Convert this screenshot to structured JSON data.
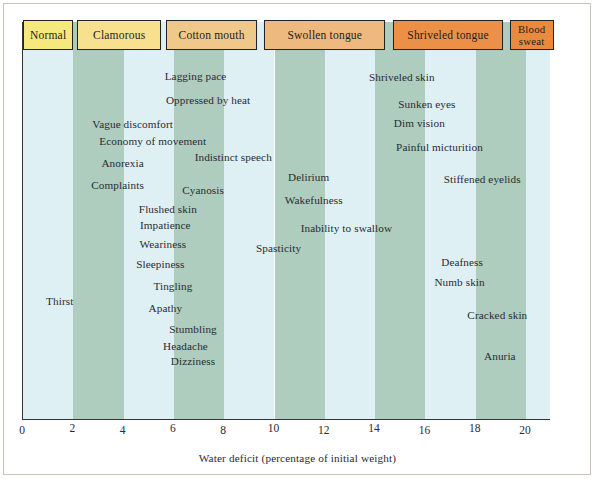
{
  "chart_data": {
    "type": "table",
    "title": "",
    "xlabel": "Water deficit (percentage of initial weight)",
    "ylabel": "",
    "xlim": [
      0,
      21
    ],
    "xticks": [
      0,
      2,
      4,
      6,
      8,
      10,
      12,
      14,
      16,
      18,
      20
    ],
    "xtick_labels": [
      "0",
      "2",
      "4",
      "6",
      "8",
      "10",
      "12",
      "14",
      "16",
      "18",
      "20"
    ],
    "grid": false,
    "band_pattern": "alternating 2-unit vertical bands",
    "band_colors": [
      "#dff0f5",
      "#aecdbe"
    ],
    "stages": [
      {
        "label": "Normal",
        "x_start": 0.0,
        "x_end": 2.0,
        "color": "#f5e87c"
      },
      {
        "label": "Clamorous",
        "x_start": 2.15,
        "x_end": 5.5,
        "color": "#f7e08e"
      },
      {
        "label": "Cotton mouth",
        "x_start": 5.7,
        "x_end": 9.3,
        "color": "#f0c98a"
      },
      {
        "label": "Swollen tongue",
        "x_start": 9.6,
        "x_end": 14.4,
        "color": "#eeb97e"
      },
      {
        "label": "Shriveled tongue",
        "x_start": 14.7,
        "x_end": 19.1,
        "color": "#ec9047"
      },
      {
        "label": "Blood sweat",
        "x_start": 19.35,
        "x_end": 21.1,
        "color": "#ea8a3c"
      }
    ],
    "symptoms": [
      {
        "label": "Lagging pace",
        "x": 6.9,
        "y": 71
      },
      {
        "label": "Oppressed by heat",
        "x": 7.4,
        "y": 95
      },
      {
        "label": "Vague discomfort",
        "x": 4.4,
        "y": 119
      },
      {
        "label": "Economy of movement",
        "x": 5.2,
        "y": 136
      },
      {
        "label": "Anorexia",
        "x": 4.0,
        "y": 158
      },
      {
        "label": "Indistinct speech",
        "x": 8.4,
        "y": 152
      },
      {
        "label": "Complaints",
        "x": 3.8,
        "y": 180
      },
      {
        "label": "Cyanosis",
        "x": 7.2,
        "y": 185
      },
      {
        "label": "Delirium",
        "x": 11.4,
        "y": 172
      },
      {
        "label": "Wakefulness",
        "x": 11.6,
        "y": 195
      },
      {
        "label": "Shriveled skin",
        "x": 15.1,
        "y": 72
      },
      {
        "label": "Sunken eyes",
        "x": 16.1,
        "y": 99
      },
      {
        "label": "Dim vision",
        "x": 15.8,
        "y": 118
      },
      {
        "label": "Painful micturition",
        "x": 16.6,
        "y": 142
      },
      {
        "label": "Stiffened eyelids",
        "x": 18.3,
        "y": 174
      },
      {
        "label": "Flushed skin",
        "x": 5.8,
        "y": 204
      },
      {
        "label": "Impatience",
        "x": 5.7,
        "y": 220
      },
      {
        "label": "Inability to swallow",
        "x": 12.9,
        "y": 223
      },
      {
        "label": "Weariness",
        "x": 5.6,
        "y": 239
      },
      {
        "label": "Spasticity",
        "x": 10.2,
        "y": 243
      },
      {
        "label": "Sleepiness",
        "x": 5.5,
        "y": 259
      },
      {
        "label": "Deafness",
        "x": 17.5,
        "y": 257
      },
      {
        "label": "Tingling",
        "x": 6.0,
        "y": 281
      },
      {
        "label": "Numb skin",
        "x": 17.4,
        "y": 277
      },
      {
        "label": "Thirst",
        "x": 1.5,
        "y": 296
      },
      {
        "label": "Apathy",
        "x": 5.7,
        "y": 303
      },
      {
        "label": "Cracked skin",
        "x": 18.9,
        "y": 310
      },
      {
        "label": "Stumbling",
        "x": 6.8,
        "y": 324
      },
      {
        "label": "Headache",
        "x": 6.5,
        "y": 341
      },
      {
        "label": "Dizziness",
        "x": 6.8,
        "y": 356
      },
      {
        "label": "Anuria",
        "x": 19.0,
        "y": 351
      }
    ]
  }
}
